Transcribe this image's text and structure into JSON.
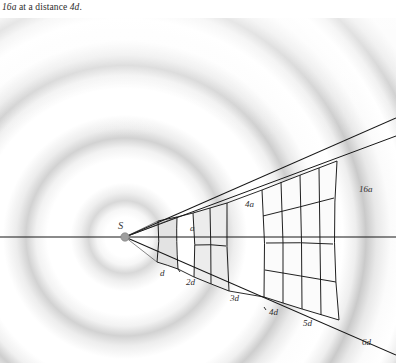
{
  "caption": {
    "prefix_italic": "16a",
    "middle": " at a distance ",
    "suffix_italic": "4d",
    "end": "."
  },
  "figure": {
    "source_label": "S",
    "area_labels": [
      {
        "text": "a",
        "x": 190,
        "y": 213
      },
      {
        "text": "4a",
        "x": 245,
        "y": 189
      },
      {
        "text": "16a",
        "x": 359,
        "y": 174
      }
    ],
    "distance_labels": [
      {
        "text": "d",
        "x": 160,
        "y": 258
      },
      {
        "text": "2d",
        "x": 188,
        "y": 267
      },
      {
        "text": "3d",
        "x": 232,
        "y": 283
      },
      {
        "text": "4d",
        "x": 271,
        "y": 297
      },
      {
        "text": "5d",
        "x": 305,
        "y": 308
      },
      {
        "text": "6d",
        "x": 364,
        "y": 327
      }
    ],
    "colors": {
      "line": "#1a1a1a",
      "patch_fill": "#e8e8e8",
      "patch_fill_light": "#f2f2f2",
      "wave_ring": "#cfcfcf",
      "background": "#ffffff",
      "source_dot": "#9a9a9a",
      "text": "#2e2e2e"
    },
    "geometry": {
      "source_x": 125,
      "source_y": 219,
      "grid_divisions": [
        1,
        2,
        4
      ],
      "description": "inverse-square-law cone from point source with 1x1, 2x2 and 4x4 patch grids"
    }
  }
}
